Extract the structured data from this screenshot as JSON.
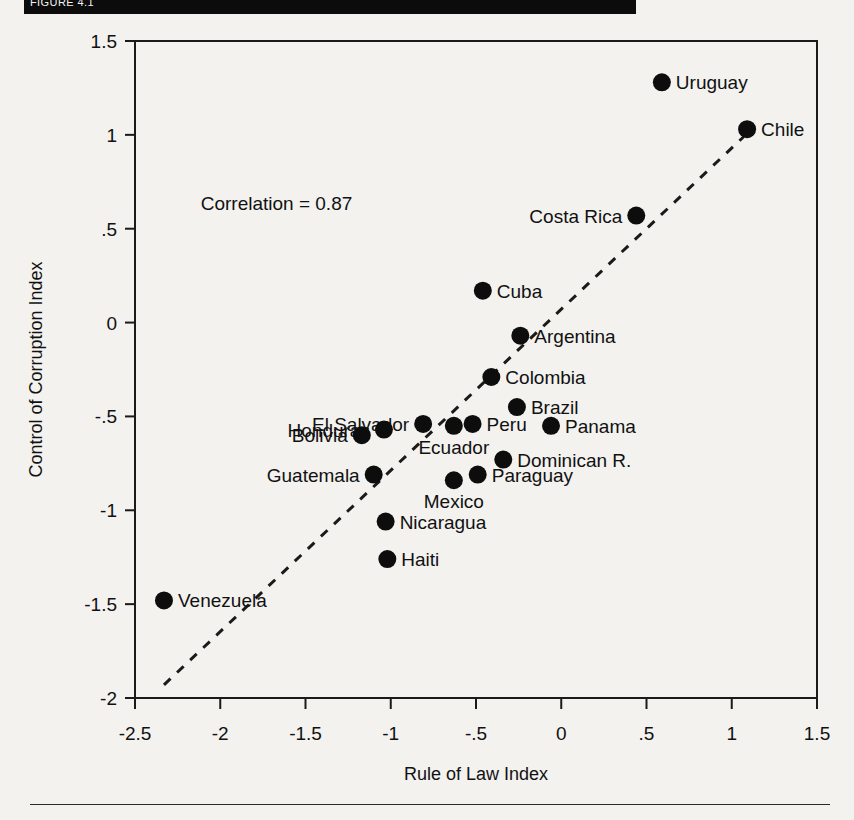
{
  "figure": {
    "caption_bar_text": "FIGURE 4.1",
    "annotation": "Correlation = 0.87"
  },
  "chart_data": {
    "type": "scatter",
    "title": "",
    "xlabel": "Rule of Law Index",
    "ylabel": "Control of Corruption Index",
    "xlim": [
      -2.5,
      1.5
    ],
    "ylim": [
      -2,
      1.5
    ],
    "xticks": [
      "-2.5",
      "-2",
      "-1.5",
      "-1",
      "-.5",
      "0",
      ".5",
      "1",
      "1.5"
    ],
    "xtick_values": [
      -2.5,
      -2,
      -1.5,
      -1,
      -0.5,
      0,
      0.5,
      1,
      1.5
    ],
    "yticks": [
      "1.5",
      "1",
      ".5",
      "0",
      "-.5",
      "-1",
      "-1.5",
      "-2"
    ],
    "ytick_values": [
      1.5,
      1,
      0.5,
      0,
      -0.5,
      -1,
      -1.5,
      -2
    ],
    "grid": false,
    "legend": "none",
    "annotations": [
      {
        "text": "Correlation = 0.87",
        "x": -1.67,
        "y": 0.6
      }
    ],
    "trendline": {
      "type": "dashed-fit",
      "x0": -2.33,
      "y0": -1.93,
      "x1": 1.07,
      "y1": 0.99
    },
    "points": [
      {
        "label": "Uruguay",
        "x": 0.59,
        "y": 1.28,
        "label_side": "right"
      },
      {
        "label": "Chile",
        "x": 1.09,
        "y": 1.03,
        "label_side": "right"
      },
      {
        "label": "Costa Rica",
        "x": 0.44,
        "y": 0.57,
        "label_side": "left"
      },
      {
        "label": "Cuba",
        "x": -0.46,
        "y": 0.17,
        "label_side": "right"
      },
      {
        "label": "Argentina",
        "x": -0.24,
        "y": -0.07,
        "label_side": "right"
      },
      {
        "label": "Colombia",
        "x": -0.41,
        "y": -0.29,
        "label_side": "right"
      },
      {
        "label": "Brazil",
        "x": -0.26,
        "y": -0.45,
        "label_side": "right"
      },
      {
        "label": "Peru",
        "x": -0.52,
        "y": -0.54,
        "label_side": "right"
      },
      {
        "label": "Panama",
        "x": -0.06,
        "y": -0.55,
        "label_side": "right"
      },
      {
        "label": "El Salvador",
        "x": -0.81,
        "y": -0.54,
        "label_side": "left"
      },
      {
        "label": "Ecuador",
        "x": -0.63,
        "y": -0.55,
        "label_side": "below"
      },
      {
        "label": "Honduras",
        "x": -1.04,
        "y": -0.57,
        "label_side": "left"
      },
      {
        "label": "Bolivia",
        "x": -1.17,
        "y": -0.6,
        "label_side": "left"
      },
      {
        "label": "Dominican R.",
        "x": -0.34,
        "y": -0.73,
        "label_side": "right"
      },
      {
        "label": "Guatemala",
        "x": -1.1,
        "y": -0.81,
        "label_side": "left"
      },
      {
        "label": "Paraguay",
        "x": -0.49,
        "y": -0.81,
        "label_side": "right"
      },
      {
        "label": "Mexico",
        "x": -0.63,
        "y": -0.84,
        "label_side": "below"
      },
      {
        "label": "Nicaragua",
        "x": -1.03,
        "y": -1.06,
        "label_side": "right"
      },
      {
        "label": "Haiti",
        "x": -1.02,
        "y": -1.26,
        "label_side": "right"
      },
      {
        "label": "Venezuela",
        "x": -2.33,
        "y": -1.48,
        "label_side": "right"
      }
    ]
  }
}
